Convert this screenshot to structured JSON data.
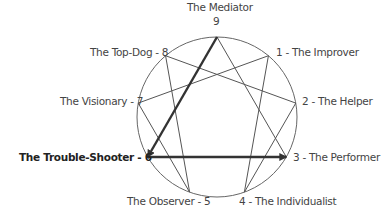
{
  "points": [
    {
      "number": 9,
      "name": "The Mediator",
      "label": "The Mediator",
      "sublabel": "9"
    },
    {
      "number": 1,
      "name": "The Improver",
      "label": "1 - The Improver"
    },
    {
      "number": 2,
      "name": "The Helper",
      "label": "2 - The Helper"
    },
    {
      "number": 3,
      "name": "The Performer",
      "label": "3 - The Performer"
    },
    {
      "number": 4,
      "name": "The Individualist",
      "label": "4 - The Individualist"
    },
    {
      "number": 5,
      "name": "The Observer",
      "label": "The Observer - 5"
    },
    {
      "number": 6,
      "name": "The Trouble-Shooter",
      "label": "The Trouble-Shooter - 6",
      "highlighted": true
    },
    {
      "number": 7,
      "name": "The Visionary",
      "label": "The Visionary - 7"
    },
    {
      "number": 8,
      "name": "The Top-Dog",
      "label": "The Top-Dog - 8"
    }
  ],
  "triangle": [
    9,
    3,
    6
  ],
  "hexad": [
    1,
    4,
    2,
    8,
    5,
    7,
    1
  ],
  "arrows": [
    {
      "from": 9,
      "to": 6
    },
    {
      "from": 6,
      "to": 3
    }
  ],
  "colors": {
    "line": "#555555",
    "arrow": "#333333",
    "text": "#444444"
  }
}
